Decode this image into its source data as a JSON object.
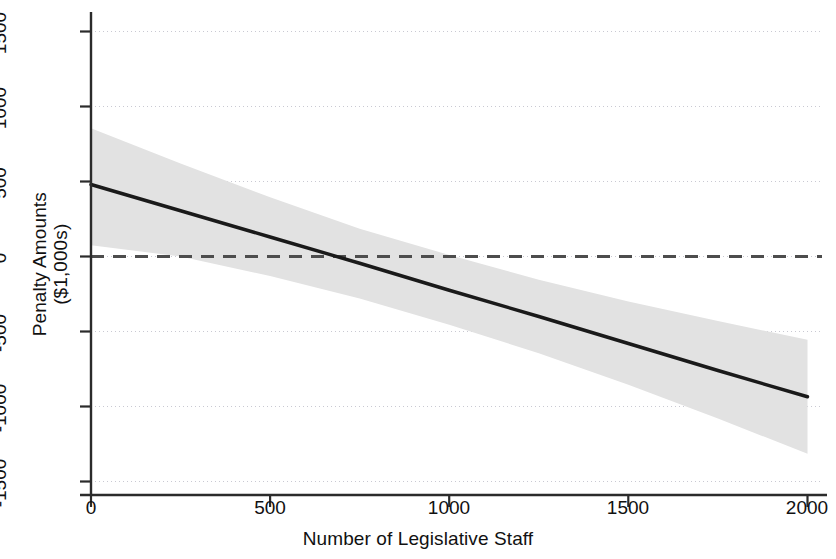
{
  "chart_data": {
    "type": "line",
    "title": "",
    "xlabel": "Number of Legislative Staff",
    "ylabel": "Penalty Amounts\n($1,000s)",
    "ylabel_line1": "Penalty Amounts",
    "ylabel_line2": "($1,000s)",
    "xlim": [
      0,
      2000
    ],
    "ylim": [
      -1500,
      1500
    ],
    "xticks": [
      0,
      500,
      1000,
      1500,
      2000
    ],
    "xtick_labels": [
      "0",
      "500",
      "1000",
      "1500",
      "2000"
    ],
    "yticks": [
      1500,
      1000,
      500,
      0,
      -500,
      -1000,
      -1500
    ],
    "ytick_labels": [
      "1500",
      "1000",
      "500",
      "0",
      "-500",
      "-1000",
      "-1500"
    ],
    "grid": "horizontal-dotted",
    "legend": "none",
    "series": [
      {
        "name": "Marginal effect (fitted line)",
        "style": "solid",
        "color": "#1a1a1a",
        "x": [
          0,
          250,
          500,
          750,
          1000,
          1250,
          1500,
          1750,
          2000
        ],
        "values": [
          480,
          305,
          130,
          -45,
          -225,
          -400,
          -580,
          -760,
          -935
        ]
      },
      {
        "name": "Zero reference line",
        "style": "dashed",
        "color": "#4d4d4d",
        "x": [
          0,
          2000
        ],
        "values": [
          0,
          0
        ]
      }
    ],
    "confidence_band": {
      "name": "95% confidence interval",
      "color": "#e2e2e2",
      "x": [
        0,
        250,
        500,
        750,
        1000,
        1250,
        1500,
        1750,
        2000
      ],
      "upper": [
        855,
        620,
        395,
        185,
        10,
        -155,
        -300,
        -430,
        -555
      ],
      "lower": [
        75,
        0,
        -130,
        -280,
        -455,
        -645,
        -855,
        -1080,
        -1315
      ]
    },
    "annotations": []
  },
  "axes": {
    "x_axis_label": "Number of Legislative Staff",
    "y_axis_label_line1": "Penalty Amounts",
    "y_axis_label_line2": "($1,000s)"
  }
}
